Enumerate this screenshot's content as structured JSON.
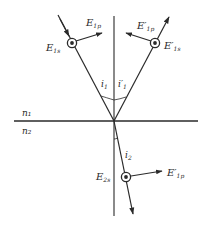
{
  "figure": {
    "media": {
      "upper": "n₁",
      "lower": "n₂"
    },
    "labels": {
      "incident_s": "E",
      "incident_s_sub": "1s",
      "incident_p": "E",
      "incident_p_sub": "1p",
      "reflected_s": "E′",
      "reflected_s_sub": "1s",
      "reflected_p": "E′",
      "reflected_p_sub": "1p",
      "refracted_s": "E",
      "refracted_s_sub": "2s",
      "refracted_p": "E′",
      "refracted_p_sub": "1p"
    },
    "angles": {
      "incidence": "i",
      "incidence_sub": "1",
      "reflection": "i′",
      "reflection_sub": "1",
      "refraction": "i",
      "refraction_sub": "2"
    },
    "colors": {
      "ink": "#2a2a2a",
      "background": "#ffffff"
    }
  }
}
